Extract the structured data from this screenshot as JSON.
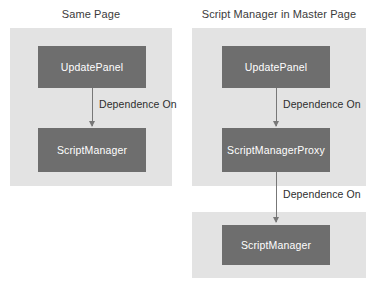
{
  "diagram": {
    "type": "flow-diagram",
    "background_color": "#ffffff",
    "panel_color": "#e3e3e3",
    "node_color": "#6e6e6e",
    "node_text_color": "#ffffff",
    "arrow_color": "#777777",
    "label_text_color": "#2e2e2e",
    "columns": [
      {
        "id": "same-page",
        "title": "Same Page",
        "panels": [
          {
            "id": "panel-left",
            "nodes": [
              "UpdatePanel",
              "ScriptManager"
            ]
          }
        ],
        "edges": [
          {
            "from": "UpdatePanel",
            "to": "ScriptManager",
            "label": "Dependence On"
          }
        ]
      },
      {
        "id": "master-page",
        "title": "Script Manager in Master Page",
        "panels": [
          {
            "id": "panel-right-upper",
            "nodes": [
              "UpdatePanel",
              "ScriptManagerProxy"
            ]
          },
          {
            "id": "panel-right-lower",
            "nodes": [
              "ScriptManager"
            ]
          }
        ],
        "edges": [
          {
            "from": "UpdatePanel",
            "to": "ScriptManagerProxy",
            "label": "Dependence On"
          },
          {
            "from": "ScriptManagerProxy",
            "to": "ScriptManager",
            "label": "Dependence On"
          }
        ]
      }
    ],
    "nodes": {
      "left_update_panel": "UpdatePanel",
      "left_script_manager": "ScriptManager",
      "right_update_panel": "UpdatePanel",
      "right_script_manager_proxy": "ScriptManagerProxy",
      "right_script_manager": "ScriptManager"
    },
    "labels": {
      "left_dependence": "Dependence On",
      "right_dependence_upper": "Dependence On",
      "right_dependence_lower": "Dependence On"
    },
    "titles": {
      "left": "Same Page",
      "right": "Script Manager in Master Page"
    }
  }
}
